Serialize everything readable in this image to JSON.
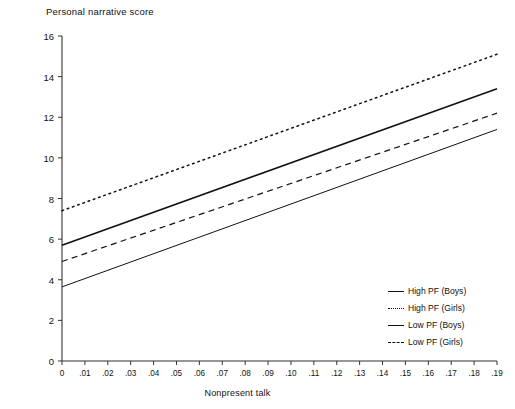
{
  "chart_data": {
    "type": "line",
    "title": "",
    "ylabel": "Personal narrative score",
    "xlabel": "Nonpresent talk",
    "xlim": [
      0,
      0.19
    ],
    "ylim": [
      0,
      16
    ],
    "grid": false,
    "legend_position": "bottom-right",
    "x_ticks": [
      "0",
      ".01",
      ".02",
      ".03",
      ".04",
      ".05",
      ".06",
      ".07",
      ".08",
      ".09",
      ".10",
      ".11",
      ".12",
      ".13",
      ".14",
      ".15",
      ".16",
      ".17",
      ".18",
      ".19"
    ],
    "x_tick_values": [
      0,
      0.01,
      0.02,
      0.03,
      0.04,
      0.05,
      0.06,
      0.07,
      0.08,
      0.09,
      0.1,
      0.11,
      0.12,
      0.13,
      0.14,
      0.15,
      0.16,
      0.17,
      0.18,
      0.19
    ],
    "y_ticks": [
      "0",
      "2",
      "4",
      "6",
      "8",
      "10",
      "12",
      "14",
      "16"
    ],
    "y_tick_values": [
      0,
      2,
      4,
      6,
      8,
      10,
      12,
      14,
      16
    ],
    "x": [
      0,
      0.19
    ],
    "series": [
      {
        "name": "High PF (Boys)",
        "style": "solid",
        "color": "#111111",
        "width": 1.6,
        "values": [
          5.7,
          13.4
        ]
      },
      {
        "name": "High PF (Girls)",
        "style": "dotted",
        "color": "#111111",
        "width": 1.5,
        "values": [
          7.4,
          15.1
        ]
      },
      {
        "name": "Low PF (Boys)",
        "style": "solid",
        "color": "#111111",
        "width": 1.0,
        "values": [
          3.65,
          11.4
        ]
      },
      {
        "name": "Low PF (Girls)",
        "style": "dashed",
        "color": "#111111",
        "width": 1.2,
        "values": [
          4.9,
          12.2
        ]
      }
    ],
    "legend_entries": [
      {
        "label": "High PF (Boys)",
        "style": "solid"
      },
      {
        "label": "High PF (Girls)",
        "style": "dotted"
      },
      {
        "label": "Low PF (Boys)",
        "style": "solid"
      },
      {
        "label": "Low PF (Girls)",
        "style": "dashed"
      }
    ]
  }
}
